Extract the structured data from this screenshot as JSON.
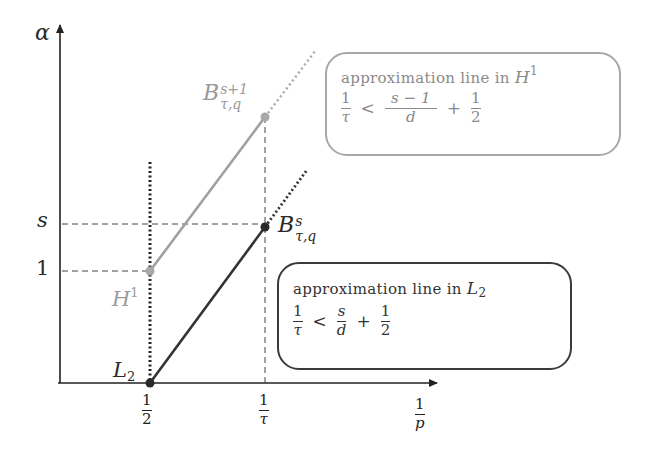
{
  "diagram": {
    "axes": {
      "y_label": "α",
      "x_label": {
        "num": "1",
        "den": "p"
      },
      "y_ticks": [
        {
          "label": "s",
          "y": 224
        },
        {
          "label": "1",
          "y": 271
        }
      ],
      "x_ticks": [
        {
          "num": "1",
          "den": "2",
          "x": 150
        },
        {
          "num": "1",
          "den": "τ",
          "x": 265
        }
      ]
    },
    "points": {
      "L2": {
        "label_base": "L",
        "label_sub": "2",
        "color": "#2a2a2a"
      },
      "H1": {
        "label_base": "H",
        "label_sup": "1",
        "color": "#9a9a9a"
      },
      "B_s": {
        "label_base": "B",
        "label_sup": "s",
        "label_sub": "τ,q",
        "color": "#2a2a2a"
      },
      "B_s1": {
        "label_base": "B",
        "label_sup": "s+1",
        "label_sub": "τ,q",
        "color": "#9a9a9a"
      }
    },
    "boxes": {
      "h1": {
        "title": "approximation line in",
        "space_base": "H",
        "space_sup": "1",
        "lhs": {
          "num": "1",
          "den": "τ"
        },
        "op": "<",
        "rhs1": {
          "num": "s − 1",
          "den": "d"
        },
        "plus": "+",
        "rhs2": {
          "num": "1",
          "den": "2"
        },
        "border_color": "#a8a8a8"
      },
      "l2": {
        "title": "approximation line in",
        "space_base": "L",
        "space_sub": "2",
        "lhs": {
          "num": "1",
          "den": "τ"
        },
        "op": "<",
        "rhs1": {
          "num": "s",
          "den": "d"
        },
        "plus": "+",
        "rhs2": {
          "num": "1",
          "den": "2"
        },
        "border_color": "#3a3a3a"
      }
    },
    "colors": {
      "axis": "#222222",
      "dark_line": "#333333",
      "gray_line": "#a0a0a0",
      "dashed": "#444444"
    }
  }
}
